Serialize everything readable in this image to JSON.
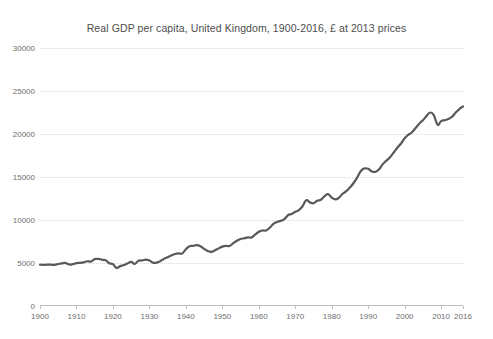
{
  "chart_data": {
    "type": "line",
    "title": "Real GDP per capita, United Kingdom, 1900-2016, £ at 2013 prices",
    "xlabel": "",
    "ylabel": "",
    "grid": true,
    "legend": false,
    "xlim": [
      1900,
      2016
    ],
    "ylim": [
      0,
      30000
    ],
    "xticks": [
      1900,
      1910,
      1920,
      1930,
      1940,
      1950,
      1960,
      1970,
      1980,
      1990,
      2000,
      2010,
      2016
    ],
    "yticks": [
      0,
      5000,
      10000,
      15000,
      20000,
      25000,
      30000
    ],
    "series": [
      {
        "name": "Real GDP per capita",
        "color": "#595959",
        "x": [
          1900,
          1901,
          1902,
          1903,
          1904,
          1905,
          1906,
          1907,
          1908,
          1909,
          1910,
          1911,
          1912,
          1913,
          1914,
          1915,
          1916,
          1917,
          1918,
          1919,
          1920,
          1921,
          1922,
          1923,
          1924,
          1925,
          1926,
          1927,
          1928,
          1929,
          1930,
          1931,
          1932,
          1933,
          1934,
          1935,
          1936,
          1937,
          1938,
          1939,
          1940,
          1941,
          1942,
          1943,
          1944,
          1945,
          1946,
          1947,
          1948,
          1949,
          1950,
          1951,
          1952,
          1953,
          1954,
          1955,
          1956,
          1957,
          1958,
          1959,
          1960,
          1961,
          1962,
          1963,
          1964,
          1965,
          1966,
          1967,
          1968,
          1969,
          1970,
          1971,
          1972,
          1973,
          1974,
          1975,
          1976,
          1977,
          1978,
          1979,
          1980,
          1981,
          1982,
          1983,
          1984,
          1985,
          1986,
          1987,
          1988,
          1989,
          1990,
          1991,
          1992,
          1993,
          1994,
          1995,
          1996,
          1997,
          1998,
          1999,
          2000,
          2001,
          2002,
          2003,
          2004,
          2005,
          2006,
          2007,
          2008,
          2009,
          2010,
          2011,
          2012,
          2013,
          2014,
          2015,
          2016
        ],
        "y": [
          4800,
          4780,
          4820,
          4800,
          4790,
          4880,
          4960,
          5000,
          4830,
          4860,
          4980,
          5020,
          5080,
          5200,
          5180,
          5450,
          5480,
          5380,
          5330,
          4980,
          4870,
          4430,
          4640,
          4760,
          4950,
          5120,
          4900,
          5270,
          5290,
          5400,
          5290,
          5030,
          5040,
          5220,
          5480,
          5680,
          5880,
          6050,
          6120,
          6110,
          6600,
          6950,
          7000,
          7080,
          6950,
          6640,
          6400,
          6300,
          6480,
          6700,
          6900,
          7000,
          6980,
          7300,
          7580,
          7800,
          7870,
          7980,
          7970,
          8300,
          8640,
          8780,
          8790,
          9100,
          9560,
          9770,
          9900,
          10100,
          10550,
          10700,
          10950,
          11150,
          11600,
          12300,
          12050,
          11950,
          12250,
          12350,
          12750,
          13000,
          12600,
          12400,
          12600,
          13050,
          13350,
          13800,
          14300,
          14950,
          15700,
          16000,
          15950,
          15650,
          15600,
          15900,
          16500,
          16900,
          17300,
          17850,
          18400,
          18900,
          19500,
          19900,
          20200,
          20700,
          21200,
          21600,
          22100,
          22500,
          22200,
          21100,
          21500,
          21600,
          21750,
          22000,
          22500,
          22900,
          23200
        ]
      }
    ]
  }
}
